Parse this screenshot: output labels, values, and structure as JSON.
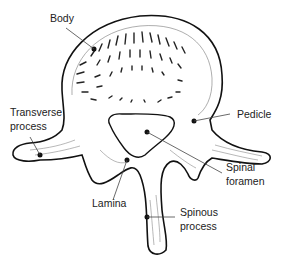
{
  "diagram": {
    "labels": {
      "body": "Body",
      "transverse_line1": "Transverse",
      "transverse_line2": "process",
      "pedicle": "Pedicle",
      "spinal_line1": "Spinal",
      "spinal_line2": "foramen",
      "lamina": "Lamina",
      "spinous_line1": "Spinous",
      "spinous_line2": "process"
    },
    "colors": {
      "line": "#111111",
      "leader": "#444444",
      "text": "#222222",
      "background": "#ffffff"
    }
  }
}
